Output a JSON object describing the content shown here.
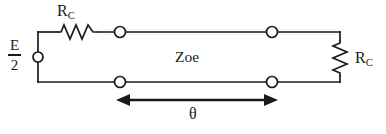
{
  "figure": {
    "name": "two-port-transmission-line-circuit",
    "background_color": "#ffffff",
    "line_color": "#1a1a1a",
    "text_color": "#1a1a1a",
    "width": 386,
    "height": 134
  },
  "labels": {
    "source_numerator": "E",
    "source_denominator": "2",
    "resistor_top": {
      "base": "R",
      "subscript": "C"
    },
    "resistor_right": {
      "base": "R",
      "subscript": "C"
    },
    "line_impedance": "Zoe",
    "length_symbol": "θ"
  },
  "elements": {
    "source_terminal": {
      "type": "open-circle-terminal",
      "x": 38,
      "y": 57,
      "r": 5
    },
    "resistor_top": {
      "type": "resistor-zigzag-horizontal",
      "x1": 58,
      "x2": 98,
      "y": 32,
      "peaks": 4
    },
    "resistor_right": {
      "type": "resistor-zigzag-vertical",
      "x": 340,
      "y1": 40,
      "y2": 76,
      "peaks": 4
    },
    "ports": [
      {
        "name": "port-top-left",
        "x": 120,
        "y": 32,
        "r": 5.5
      },
      {
        "name": "port-top-right",
        "x": 272,
        "y": 32,
        "r": 5.5
      },
      {
        "name": "port-bottom-left",
        "x": 120,
        "y": 82,
        "r": 5.5
      },
      {
        "name": "port-bottom-right",
        "x": 272,
        "y": 82,
        "r": 5.5
      }
    ],
    "wires": {
      "top_y": 32,
      "bottom_y": 82,
      "left_x": 38,
      "right_x": 340
    },
    "dimension_arrow": {
      "type": "double-headed-arrow",
      "x1": 118,
      "x2": 276,
      "y": 100
    }
  }
}
